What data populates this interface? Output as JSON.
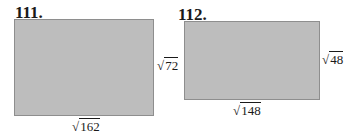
{
  "problems": [
    {
      "number": "111.",
      "side_label": "72",
      "bottom_label": "162",
      "fill": "#bdbdbd"
    },
    {
      "number": "112.",
      "side_label": "48",
      "bottom_label": "148",
      "fill": "#bdbdbd"
    }
  ],
  "radical_symbol": "√"
}
